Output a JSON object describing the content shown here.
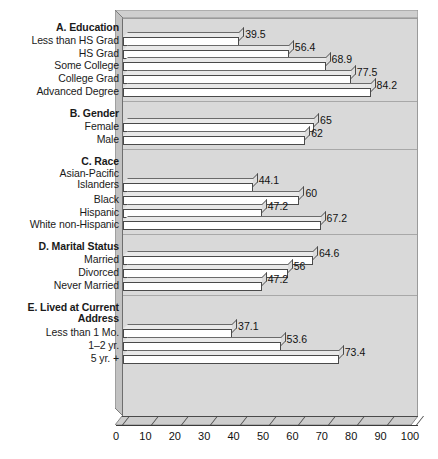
{
  "chart_data": {
    "type": "bar",
    "orientation": "horizontal",
    "title": "",
    "xlabel": "",
    "ylabel": "",
    "xlim": [
      0,
      100
    ],
    "grid": false,
    "legend": null,
    "xticks": [
      "0",
      "10",
      "20",
      "30",
      "40",
      "50",
      "60",
      "70",
      "80",
      "90",
      "100"
    ],
    "xtick_values": [
      0,
      10,
      20,
      30,
      40,
      50,
      60,
      70,
      80,
      90,
      100
    ],
    "groups": [
      {
        "id": "A",
        "heading": "A. Education",
        "heading_lines": [
          "A. Education"
        ],
        "categories": [
          "Less than HS Grad",
          "HS Grad",
          "Some College",
          "College Grad",
          "Advanced Degree"
        ],
        "values": [
          39.5,
          56.4,
          68.9,
          77.5,
          84.2
        ],
        "value_labels": [
          "39.5",
          "56.4",
          "68.9",
          "77.5",
          "84.2"
        ]
      },
      {
        "id": "B",
        "heading": "B. Gender",
        "heading_lines": [
          "B. Gender"
        ],
        "categories": [
          "Female",
          "Male"
        ],
        "values": [
          65,
          62
        ],
        "value_labels": [
          "65",
          "62"
        ]
      },
      {
        "id": "C",
        "heading": "C. Race",
        "heading_lines": [
          "C. Race"
        ],
        "categories": [
          "Asian-Pacific\nIslanders",
          "Black",
          "Hispanic",
          "White non-Hispanic"
        ],
        "values": [
          44.1,
          60,
          47.2,
          67.2
        ],
        "value_labels": [
          "44.1",
          "60",
          "47.2",
          "67.2"
        ]
      },
      {
        "id": "D",
        "heading": "D. Marital Status",
        "heading_lines": [
          "D. Marital Status"
        ],
        "categories": [
          "Married",
          "Divorced",
          "Never Married"
        ],
        "values": [
          64.6,
          56,
          47.2
        ],
        "value_labels": [
          "64.6",
          "56",
          "47.2"
        ]
      },
      {
        "id": "E",
        "heading": "E. Lived at Current\nAddress",
        "heading_lines": [
          "E. Lived at Current",
          "Address"
        ],
        "categories": [
          "Less than 1 Mo.",
          "1–2 yr.",
          "5 yr. +"
        ],
        "values": [
          37.1,
          53.6,
          73.4
        ],
        "value_labels": [
          "37.1",
          "53.6",
          "73.4"
        ]
      }
    ],
    "colors": {
      "plot_background": "#d9d9d9",
      "bar_face": "#ffffff",
      "bar_top": "#e9e9e9",
      "bar_side": "#dcdcdc",
      "outline": "#4a4a4a",
      "text": "#111111",
      "page_background": "#ffffff"
    }
  }
}
